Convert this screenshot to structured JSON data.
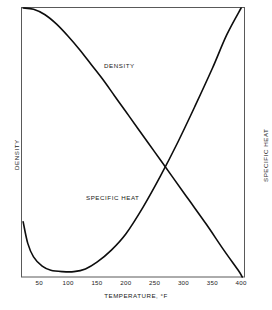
{
  "chart_data": {
    "type": "line",
    "title": "",
    "xlabel": "TEMPERATURE, °F",
    "ylabel_left": "DENSITY",
    "ylabel_right": "SPECIFIC HEAT",
    "grid": false,
    "legend_position": "inline-annotations",
    "xlim": [
      20,
      405
    ],
    "xticks": [
      50,
      100,
      150,
      200,
      250,
      300,
      350,
      400
    ],
    "xtick_labels": [
      "50",
      "100",
      "150",
      "200",
      "250",
      "300",
      "350",
      "400"
    ],
    "series": [
      {
        "name": "DENSITY",
        "axis": "left",
        "annotation": "DENSITY",
        "x": [
          22,
          40,
          60,
          80,
          100,
          120,
          140,
          160,
          180,
          200,
          220,
          250,
          280,
          310,
          340,
          370,
          395,
          402
        ],
        "y": [
          1.0,
          0.995,
          0.975,
          0.94,
          0.895,
          0.845,
          0.79,
          0.735,
          0.675,
          0.615,
          0.555,
          0.465,
          0.375,
          0.285,
          0.195,
          0.1,
          0.025,
          0.0
        ]
      },
      {
        "name": "SPECIFIC HEAT",
        "axis": "right",
        "annotation": "SPECIFIC HEAT",
        "x": [
          22,
          30,
          40,
          55,
          70,
          90,
          110,
          130,
          150,
          175,
          200,
          230,
          260,
          290,
          320,
          350,
          375,
          400
        ],
        "y": [
          0.205,
          0.125,
          0.075,
          0.04,
          0.025,
          0.02,
          0.02,
          0.03,
          0.055,
          0.1,
          0.16,
          0.26,
          0.375,
          0.5,
          0.635,
          0.775,
          0.9,
          1.0
        ]
      }
    ],
    "annotations": [
      {
        "text": "DENSITY",
        "x": 150,
        "y": 0.83
      },
      {
        "text": "SPECIFIC HEAT",
        "x": 130,
        "y": 0.34
      }
    ],
    "colors": {
      "line": "#0d0d0d",
      "frame": "#4d4d4d",
      "background": "#ffffff"
    }
  },
  "axes": {
    "x_title": "TEMPERATURE, °F",
    "y_left_title": "DENSITY",
    "y_right_title": "SPECIFIC HEAT",
    "x_tick_labels": [
      "50",
      "100",
      "150",
      "200",
      "250",
      "300",
      "350",
      "400"
    ]
  },
  "labels": {
    "density": "DENSITY",
    "specific_heat": "SPECIFIC HEAT"
  }
}
